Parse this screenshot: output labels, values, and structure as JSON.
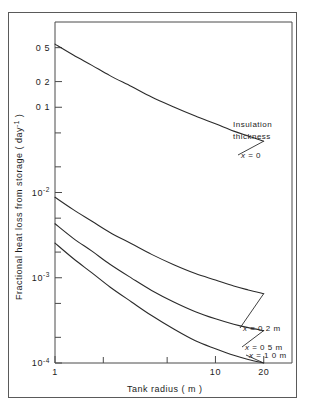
{
  "figure": {
    "background": "#ffffff",
    "frame_color": "#5a5a5a",
    "axis_color": "#4a4a4a",
    "curve_color": "#2b2b2b"
  },
  "chart_data": {
    "type": "line",
    "title": "",
    "xlabel": "Tank radius ( m )",
    "ylabel": "Fractional heat loss from storage ( day-1 )",
    "ylabel_main": "Fractional heat loss from storage ( day",
    "ylabel_sup": "-1",
    "ylabel_tail": " )",
    "xscale": "log",
    "yscale": "log",
    "xlim": [
      1,
      30
    ],
    "ylim": [
      0.0001,
      1.0
    ],
    "grid": false,
    "legend": "inline-labels",
    "xticks": [
      1,
      2,
      5,
      10,
      20
    ],
    "xtick_labels": [
      "1",
      "",
      "",
      "10",
      "20"
    ],
    "ytick_values": [
      0.5,
      0.2,
      0.1,
      0.05,
      0.02,
      0.01,
      0.005,
      0.002,
      0.001,
      0.0005,
      0.0002,
      0.0001
    ],
    "ytick_labels": [
      "0.5",
      "0.2",
      "0.1",
      "",
      "",
      "10-2",
      "",
      "",
      "10-3",
      "",
      "",
      "10-4"
    ],
    "ytick_labels_display": [
      {
        "text": "0 5",
        "sup": ""
      },
      {
        "text": "0 2",
        "sup": ""
      },
      {
        "text": "0 1",
        "sup": ""
      },
      {
        "text": "",
        "sup": ""
      },
      {
        "text": "",
        "sup": ""
      },
      {
        "text": "10",
        "sup": "-2"
      },
      {
        "text": "",
        "sup": ""
      },
      {
        "text": "",
        "sup": ""
      },
      {
        "text": "10",
        "sup": "-3"
      },
      {
        "text": "",
        "sup": ""
      },
      {
        "text": "",
        "sup": ""
      },
      {
        "text": "10",
        "sup": "-4"
      }
    ],
    "annotation_heading_line1": "Insulation",
    "annotation_heading_line2": "thickness",
    "series": [
      {
        "name": "x = 0",
        "label": "x = 0",
        "insulation_thickness_m": 0,
        "x": [
          1,
          1.3,
          1.7,
          2.2,
          3,
          4,
          5.5,
          7.5,
          10,
          13,
          16,
          20
        ],
        "y": [
          0.55,
          0.41,
          0.31,
          0.235,
          0.175,
          0.132,
          0.101,
          0.079,
          0.064,
          0.0525,
          0.046,
          0.04
        ]
      },
      {
        "name": "x = 0.2 m",
        "label": "x = 0.2 m",
        "insulation_thickness_m": 0.2,
        "x": [
          1,
          1.3,
          1.7,
          2.2,
          3,
          4,
          5.5,
          7.5,
          10,
          13,
          16,
          20
        ],
        "y": [
          0.0088,
          0.0063,
          0.0046,
          0.0034,
          0.0025,
          0.00188,
          0.00142,
          0.00112,
          0.00094,
          0.0008,
          0.00072,
          0.00065
        ]
      },
      {
        "name": "x = 0.5 m",
        "label": "x = 0.5 m",
        "insulation_thickness_m": 0.5,
        "x": [
          1,
          1.3,
          1.7,
          2.2,
          3,
          4,
          5.5,
          7.5,
          10,
          13,
          16,
          20
        ],
        "y": [
          0.0043,
          0.0029,
          0.00205,
          0.00144,
          0.00099,
          0.00071,
          0.00052,
          0.0004,
          0.00033,
          0.000285,
          0.00026,
          0.00024
        ]
      },
      {
        "name": "x = 1.0 m",
        "label": "x = 1.0 m",
        "insulation_thickness_m": 1.0,
        "x": [
          1,
          1.3,
          1.7,
          2.2,
          3,
          4,
          5.5,
          7.5,
          10,
          13,
          16,
          20
        ],
        "y": [
          0.00255,
          0.00168,
          0.00114,
          0.00078,
          0.00052,
          0.00036,
          0.00025,
          0.000182,
          0.000147,
          0.000123,
          0.00011,
          0.0001
        ]
      }
    ]
  }
}
